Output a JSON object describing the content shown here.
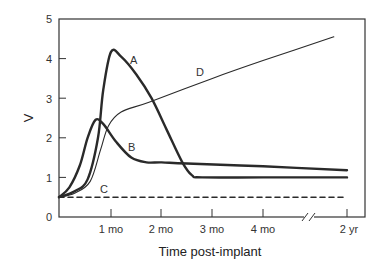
{
  "chart_data": {
    "type": "line",
    "title": "",
    "xlabel": "Time post-implant",
    "ylabel": "V",
    "ylim": [
      0,
      5
    ],
    "yticks": [
      0,
      1,
      2,
      3,
      4,
      5
    ],
    "xticks": [
      "1 mo",
      "2 mo",
      "3 mo",
      "4 mo",
      "2 yr"
    ],
    "x_axis_break": "between 4 mo and 2 yr",
    "grid": false,
    "legend": "inline labels",
    "x_units": "months (2 yr plotted after axis break)",
    "series": [
      {
        "name": "A",
        "style": "thick solid",
        "points": [
          [
            0,
            0.5
          ],
          [
            0.3,
            0.65
          ],
          [
            0.55,
            0.95
          ],
          [
            0.75,
            2.0
          ],
          [
            0.85,
            3.2
          ],
          [
            1.0,
            4.17
          ],
          [
            1.2,
            4.05
          ],
          [
            1.5,
            3.6
          ],
          [
            1.8,
            3.0
          ],
          [
            2.1,
            2.2
          ],
          [
            2.4,
            1.4
          ],
          [
            2.6,
            1.05
          ],
          [
            2.8,
            1.0
          ],
          [
            4.0,
            1.0
          ],
          [
            5.66,
            1.0
          ]
        ],
        "label_pos": [
          1.45,
          4.05
        ]
      },
      {
        "name": "B",
        "style": "thick solid",
        "points": [
          [
            0,
            0.5
          ],
          [
            0.2,
            0.75
          ],
          [
            0.4,
            1.3
          ],
          [
            0.55,
            2.0
          ],
          [
            0.7,
            2.45
          ],
          [
            0.85,
            2.35
          ],
          [
            1.1,
            1.9
          ],
          [
            1.4,
            1.5
          ],
          [
            1.7,
            1.38
          ],
          [
            2.0,
            1.38
          ],
          [
            2.5,
            1.35
          ],
          [
            4.0,
            1.28
          ],
          [
            5.66,
            1.18
          ]
        ],
        "label_pos": [
          1.42,
          1.78
        ]
      },
      {
        "name": "C",
        "style": "dashed",
        "points": [
          [
            0,
            0.5
          ],
          [
            5.66,
            0.5
          ]
        ],
        "label_pos": [
          1.0,
          0.65
        ]
      },
      {
        "name": "D",
        "style": "thin solid",
        "points": [
          [
            0,
            0.5
          ],
          [
            0.3,
            0.6
          ],
          [
            0.6,
            0.9
          ],
          [
            0.8,
            1.7
          ],
          [
            0.95,
            2.3
          ],
          [
            1.2,
            2.65
          ],
          [
            1.75,
            2.9
          ],
          [
            3.0,
            3.5
          ],
          [
            4.0,
            3.95
          ],
          [
            5.4,
            4.55
          ]
        ],
        "label_pos": [
          2.75,
          3.65
        ]
      }
    ]
  },
  "axes": {
    "y_label": "V",
    "x_label": "Time post-implant",
    "y_tick_labels": [
      "0",
      "1",
      "2",
      "3",
      "4",
      "5"
    ],
    "x_tick_labels": [
      "1 mo",
      "2 mo",
      "3 mo",
      "4 mo",
      "2 yr"
    ]
  },
  "series_labels": {
    "A": "A",
    "B": "B",
    "C": "C",
    "D": "D"
  },
  "colors": {
    "line": "#2a2a2a",
    "axis": "#333333",
    "background": "#ffffff"
  }
}
